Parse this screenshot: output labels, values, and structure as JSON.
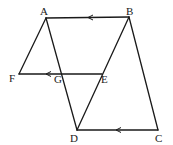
{
  "diagram": {
    "points": {
      "A": {
        "label": "A"
      },
      "B": {
        "label": "B"
      },
      "C": {
        "label": "C"
      },
      "D": {
        "label": "D"
      },
      "E": {
        "label": "E"
      },
      "F": {
        "label": "F"
      },
      "G": {
        "label": "G"
      }
    },
    "segments": [
      {
        "from": "A",
        "to": "B",
        "arrow": "toward A"
      },
      {
        "from": "B",
        "to": "C"
      },
      {
        "from": "D",
        "to": "C",
        "arrow": "toward D"
      },
      {
        "from": "A",
        "to": "D"
      },
      {
        "from": "B",
        "to": "D"
      },
      {
        "from": "A",
        "to": "F"
      },
      {
        "from": "F",
        "to": "E",
        "arrow": "toward F"
      }
    ],
    "parallel_marks": "single arrowheads on AB, FE and DC indicate AB ∥ FE ∥ DC"
  }
}
